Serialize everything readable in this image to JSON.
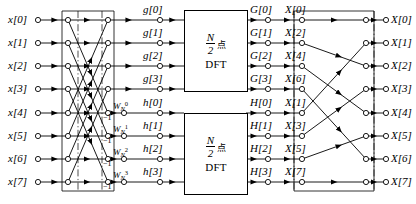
{
  "inputs": [
    {
      "label": "x[0]"
    },
    {
      "label": "x[1]"
    },
    {
      "label": "x[2]"
    },
    {
      "label": "x[3]"
    },
    {
      "label": "x[4]"
    },
    {
      "label": "x[5]"
    },
    {
      "label": "x[6]"
    },
    {
      "label": "x[7]"
    }
  ],
  "stage1": {
    "butterfly_pairs": [
      [
        0,
        4
      ],
      [
        1,
        5
      ],
      [
        2,
        6
      ],
      [
        3,
        7
      ]
    ],
    "minus_one_labels": [
      "-1",
      "-1",
      "-1",
      "-1"
    ],
    "minus_one_symbol": "−1"
  },
  "twiddles": [
    {
      "base": "W",
      "sub": "N",
      "sup": "0"
    },
    {
      "base": "W",
      "sub": "N",
      "sup": "1"
    },
    {
      "base": "W",
      "sub": "N",
      "sup": "2"
    },
    {
      "base": "W",
      "sub": "N",
      "sup": "3"
    }
  ],
  "intermediate": {
    "upper": [
      "g[0]",
      "g[1]",
      "g[2]",
      "g[3]"
    ],
    "lower": [
      "h[0]",
      "h[1]",
      "h[2]",
      "h[3]"
    ]
  },
  "dft_blocks": [
    {
      "numerator": "N",
      "denominator": "2",
      "unit": "点",
      "name": "DFT"
    },
    {
      "numerator": "N",
      "denominator": "2",
      "unit": "点",
      "name": "DFT"
    }
  ],
  "dft_outputs": {
    "upper": [
      "G[0]",
      "G[1]",
      "G[2]",
      "G[3]"
    ],
    "lower": [
      "H[0]",
      "H[1]",
      "H[2]",
      "H[3]"
    ]
  },
  "relabeled": [
    "X[0]",
    "X[2]",
    "X[4]",
    "X[6]",
    "X[1]",
    "X[3]",
    "X[5]",
    "X[7]"
  ],
  "outputs": [
    "X[0]",
    "X[1]",
    "X[2]",
    "X[3]",
    "X[4]",
    "X[5]",
    "X[6]",
    "X[7]"
  ],
  "reorder_map": [
    0,
    4,
    1,
    5,
    2,
    6,
    3,
    7
  ],
  "colors": {
    "line": "#000000",
    "node_fill": "#ffffff",
    "background": "#ffffff"
  }
}
